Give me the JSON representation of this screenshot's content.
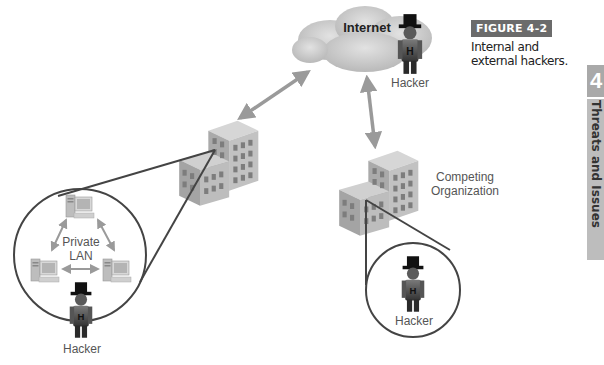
{
  "figure": {
    "tag": "FIGURE 4-2",
    "caption": "Internal and external hackers."
  },
  "side_tab": {
    "chapter_number": "4",
    "section_title": "Threats and Issues"
  },
  "nodes": {
    "internet": {
      "label": "Internet"
    },
    "external_hacker": {
      "label": "Hacker",
      "badge": "H"
    },
    "company_building": {
      "label": ""
    },
    "competitor_building": {
      "label_line1": "Competing",
      "label_line2": "Organization"
    },
    "private_lan": {
      "label_line1": "Private",
      "label_line2": "LAN"
    },
    "internal_hacker": {
      "label": "Hacker",
      "badge": "H"
    },
    "competitor_hacker": {
      "label": "Hacker",
      "badge": "H"
    }
  },
  "colors": {
    "cloud": "#c8c8c8",
    "arrow": "#9a9a9a",
    "callout_line": "#444444",
    "building_front": "#a8a8a8",
    "building_side": "#c4c4c4",
    "figure_tag_bg": "#6b6b6b",
    "side_tab_bg": "#bdbdbd"
  }
}
